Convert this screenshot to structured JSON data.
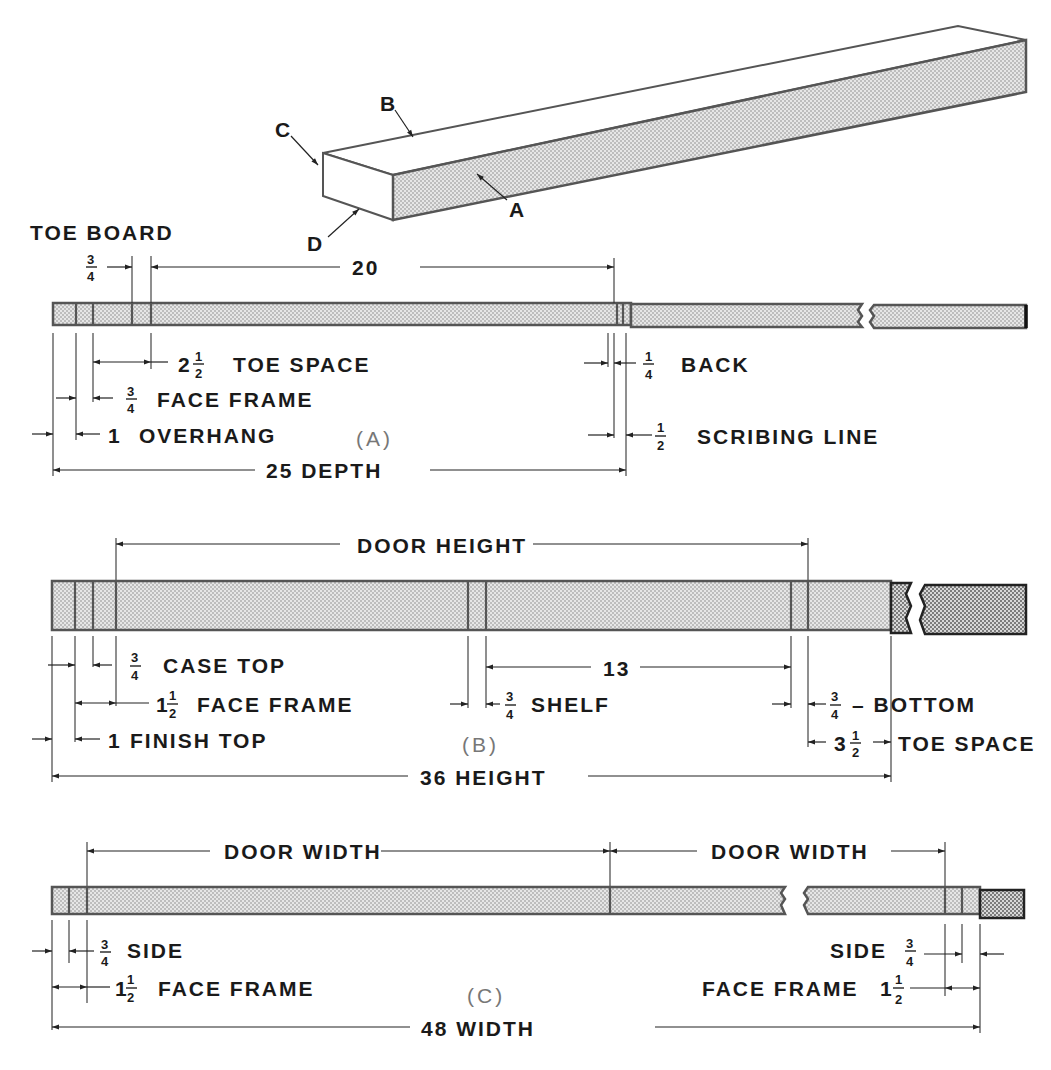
{
  "figure": {
    "type": "technical-drawing",
    "colors": {
      "ink": "#1a1a1a",
      "board_outline": "#555555",
      "stipple": "#9a9a9a",
      "panel_label": "#777777"
    }
  },
  "isometric": {
    "labels": {
      "a": "A",
      "b": "B",
      "c": "C",
      "d": "D"
    }
  },
  "panel_a": {
    "panel_label": "(A)",
    "title": "TOE BOARD",
    "dims": {
      "toe_board_num": "3",
      "toe_board_den": "4",
      "top_span": "20",
      "toe_space_whole": "2",
      "toe_space_num": "1",
      "toe_space_den": "2",
      "toe_space_text": "TOE SPACE",
      "face_frame_num": "3",
      "face_frame_den": "4",
      "face_frame_text": "FACE FRAME",
      "overhang_whole": "1",
      "overhang_text": "OVERHANG",
      "back_num": "1",
      "back_den": "4",
      "back_text": "BACK",
      "scribe_num": "1",
      "scribe_den": "2",
      "scribe_text": "SCRIBING LINE",
      "depth_text": "25 DEPTH"
    }
  },
  "panel_b": {
    "panel_label": "(B)",
    "dims": {
      "door_height_text": "DOOR HEIGHT",
      "case_top_num": "3",
      "case_top_den": "4",
      "case_top_text": "CASE TOP",
      "face_frame_whole": "1",
      "face_frame_num": "1",
      "face_frame_den": "2",
      "face_frame_text": "FACE FRAME",
      "finish_top_whole": "1",
      "finish_top_text": "FINISH TOP",
      "shelf_span": "13",
      "shelf_num": "3",
      "shelf_den": "4",
      "shelf_text": "SHELF",
      "bottom_num": "3",
      "bottom_den": "4",
      "bottom_text": "– BOTTOM",
      "toe_space_whole": "3",
      "toe_space_num": "1",
      "toe_space_den": "2",
      "toe_space_text": "TOE SPACE",
      "height_text": "36 HEIGHT"
    }
  },
  "panel_c": {
    "panel_label": "(C)",
    "dims": {
      "door_width_left": "DOOR WIDTH",
      "door_width_right": "DOOR WIDTH",
      "side_left_num": "3",
      "side_left_den": "4",
      "side_left_text": "SIDE",
      "face_frame_left_whole": "1",
      "face_frame_left_num": "1",
      "face_frame_left_den": "2",
      "face_frame_left_text": "FACE FRAME",
      "side_right_text": "SIDE",
      "side_right_num": "3",
      "side_right_den": "4",
      "face_frame_right_text": "FACE FRAME",
      "face_frame_right_whole": "1",
      "face_frame_right_num": "1",
      "face_frame_right_den": "2",
      "width_text": "48 WIDTH"
    }
  }
}
